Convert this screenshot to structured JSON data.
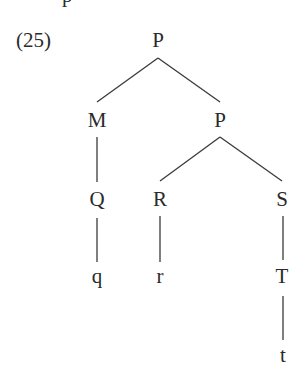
{
  "example_number": "(25)",
  "top_fragment": "p",
  "tree": {
    "nodes": [
      {
        "id": "root",
        "label": "P",
        "x": 158,
        "y": 30
      },
      {
        "id": "m",
        "label": "M",
        "x": 97,
        "y": 110
      },
      {
        "id": "p2",
        "label": "P",
        "x": 220,
        "y": 110
      },
      {
        "id": "q_node",
        "label": "Q",
        "x": 97,
        "y": 189
      },
      {
        "id": "r_node",
        "label": "R",
        "x": 160,
        "y": 189
      },
      {
        "id": "s_node",
        "label": "S",
        "x": 282,
        "y": 189
      },
      {
        "id": "q_leaf",
        "label": "q",
        "x": 97,
        "y": 266
      },
      {
        "id": "r_leaf",
        "label": "r",
        "x": 160,
        "y": 266
      },
      {
        "id": "t_node",
        "label": "T",
        "x": 282,
        "y": 266
      },
      {
        "id": "t_leaf",
        "label": "t",
        "x": 283,
        "y": 345
      }
    ],
    "edges": [
      {
        "from": "root",
        "to": "m"
      },
      {
        "from": "root",
        "to": "p2"
      },
      {
        "from": "m",
        "to": "q_node"
      },
      {
        "from": "p2",
        "to": "r_node"
      },
      {
        "from": "p2",
        "to": "s_node"
      },
      {
        "from": "q_node",
        "to": "q_leaf"
      },
      {
        "from": "r_node",
        "to": "r_leaf"
      },
      {
        "from": "s_node",
        "to": "t_node"
      },
      {
        "from": "t_node",
        "to": "t_leaf"
      }
    ]
  }
}
